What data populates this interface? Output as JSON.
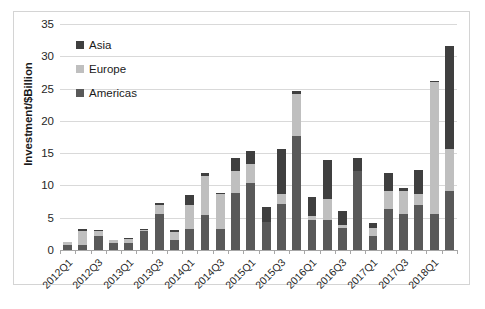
{
  "chart_data": {
    "type": "bar",
    "subtype": "stacked-bar",
    "title": "",
    "xlabel": "",
    "ylabel": "Investment/$Billion",
    "ylim": [
      0,
      35
    ],
    "ytick_step": 5,
    "yticks": [
      "0",
      "5",
      "10",
      "15",
      "20",
      "25",
      "30",
      "35"
    ],
    "grid": true,
    "legend_position": "top-left-inside",
    "legend": [
      "Asia",
      "Europe",
      "Americas"
    ],
    "stack_order_bottom_to_top": [
      "Americas",
      "Europe",
      "Asia"
    ],
    "colors": {
      "Asia": "#3f3f3f",
      "Europe": "#bfbfbf",
      "Americas": "#595959",
      "gridline": "#d9d9d9",
      "axis": "#a6a6a6",
      "border": "#d4d4d4",
      "text": "#262626"
    },
    "categories": [
      "2012Q1",
      "2012Q2",
      "2012Q3",
      "2012Q4",
      "2013Q1",
      "2013Q2",
      "2013Q3",
      "2013Q4",
      "2014Q1",
      "2014Q2",
      "2014Q3",
      "2014Q4",
      "2015Q1",
      "2015Q2",
      "2015Q3",
      "2015Q4",
      "2016Q1",
      "2016Q2",
      "2016Q3",
      "2016Q4",
      "2017Q1",
      "2017Q2",
      "2017Q3",
      "2017Q4",
      "2018Q1",
      "2018Q2"
    ],
    "tick_labels_shown": [
      "2012Q1",
      "2012Q3",
      "2013Q1",
      "2013Q3",
      "2014Q1",
      "2014Q3",
      "2015Q1",
      "2015Q3",
      "2016Q1",
      "2016Q3",
      "2017Q1",
      "2017Q3",
      "2018Q1"
    ],
    "series": [
      {
        "name": "Americas",
        "values": [
          0.7,
          0.8,
          2.2,
          1.1,
          1.1,
          3.0,
          5.6,
          1.6,
          3.3,
          5.4,
          3.2,
          8.9,
          10.4,
          4.3,
          7.1,
          17.7,
          4.6,
          4.7,
          3.4,
          12.2,
          2.2,
          6.4,
          5.6,
          7.0,
          5.6,
          9.1
        ]
      },
      {
        "name": "Europe",
        "values": [
          0.5,
          2.2,
          0.7,
          0.4,
          0.6,
          0.1,
          1.4,
          1.2,
          3.6,
          6.1,
          5.4,
          3.3,
          2.9,
          0.1,
          1.6,
          6.4,
          0.6,
          3.2,
          0.4,
          0.1,
          1.2,
          2.7,
          3.5,
          1.6,
          20.4,
          6.6
        ]
      },
      {
        "name": "Asia",
        "values": [
          0.1,
          0.2,
          0.2,
          0.1,
          0.2,
          0.1,
          0.3,
          0.3,
          1.6,
          0.4,
          0.2,
          2.0,
          2.1,
          2.2,
          6.9,
          0.6,
          3.0,
          6.0,
          2.2,
          1.9,
          0.8,
          2.8,
          0.5,
          3.8,
          0.1,
          15.9
        ]
      }
    ],
    "totals": [
      1.3,
      3.2,
      3.1,
      1.6,
      1.9,
      3.2,
      7.3,
      3.1,
      8.5,
      11.9,
      8.8,
      14.2,
      15.4,
      6.6,
      15.6,
      24.7,
      8.2,
      13.9,
      6.0,
      14.2,
      4.2,
      11.9,
      9.6,
      12.4,
      26.1,
      31.6
    ]
  }
}
